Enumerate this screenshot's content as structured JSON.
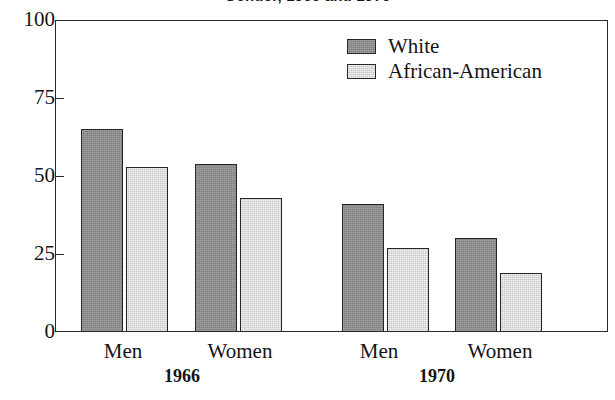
{
  "chart_data": {
    "type": "bar",
    "title": "Gender, 1966 and 1970",
    "xlabel": "",
    "ylabel": "",
    "ylim": [
      0,
      100
    ],
    "yticks": [
      "0",
      "25",
      "50",
      "75",
      "100"
    ],
    "grid": false,
    "legend_position": "top-right",
    "categories": [
      "Men",
      "Women",
      "Men",
      "Women"
    ],
    "groups": [
      {
        "period": "1966",
        "categories": [
          "Men",
          "Women"
        ]
      },
      {
        "period": "1970",
        "categories": [
          "Men",
          "Women"
        ]
      }
    ],
    "series": [
      {
        "name": "White",
        "color": "#8d8d8d",
        "values": [
          65,
          54,
          41,
          30
        ]
      },
      {
        "name": "African-American",
        "color": "#dedede",
        "values": [
          53,
          43,
          27,
          19
        ]
      }
    ],
    "bars": [
      {
        "label": "White Men 1966",
        "series": "White",
        "group": "Men",
        "period": "1966",
        "value": 65,
        "x": 81,
        "width": 42,
        "variant": "series-white"
      },
      {
        "label": "African-American Men 1966",
        "series": "African-American",
        "group": "Men",
        "period": "1966",
        "value": 53,
        "x": 126,
        "width": 42,
        "variant": "series-aa"
      },
      {
        "label": "White Women 1966",
        "series": "White",
        "group": "Women",
        "period": "1966",
        "value": 54,
        "x": 195,
        "width": 42,
        "variant": "series-white"
      },
      {
        "label": "African-American Women 1966",
        "series": "African-American",
        "group": "Women",
        "period": "1966",
        "value": 43,
        "x": 240,
        "width": 42,
        "variant": "series-aa"
      },
      {
        "label": "White Men 1970",
        "series": "White",
        "group": "Men",
        "period": "1970",
        "value": 41,
        "x": 342,
        "width": 42,
        "variant": "series-white"
      },
      {
        "label": "African-American Men 1970",
        "series": "African-American",
        "group": "Men",
        "period": "1970",
        "value": 27,
        "x": 387,
        "width": 42,
        "variant": "series-aa"
      },
      {
        "label": "White Women 1970",
        "series": "White",
        "group": "Women",
        "period": "1970",
        "value": 30,
        "x": 455,
        "width": 42,
        "variant": "series-white"
      },
      {
        "label": "African-American Women 1970",
        "series": "African-American",
        "group": "Women",
        "period": "1970",
        "value": 19,
        "x": 500,
        "width": 42,
        "variant": "series-aa"
      }
    ],
    "x_group_labels": [
      {
        "text": "Men",
        "center": 123
      },
      {
        "text": "Women",
        "center": 240
      },
      {
        "text": "Men",
        "center": 379
      },
      {
        "text": "Women",
        "center": 500
      }
    ],
    "x_period_labels": [
      {
        "text": "1966",
        "center": 182
      },
      {
        "text": "1970",
        "center": 437
      }
    ]
  },
  "legend": {
    "items": [
      {
        "label": "White",
        "variant": "series-white"
      },
      {
        "label": "African-American",
        "variant": "series-aa"
      }
    ]
  },
  "axes": {
    "plot": {
      "left": 55,
      "top": 20,
      "width": 553,
      "height": 312
    },
    "y": {
      "ticks": [
        {
          "label": "100",
          "value": 100
        },
        {
          "label": "75",
          "value": 75
        },
        {
          "label": "50",
          "value": 50
        },
        {
          "label": "25",
          "value": 25
        },
        {
          "label": "0",
          "value": 0
        }
      ]
    }
  }
}
